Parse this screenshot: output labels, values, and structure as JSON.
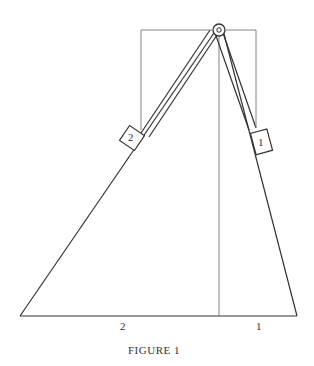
{
  "figure": {
    "caption": "FIGURE 1",
    "base_labels": {
      "left": "2",
      "right": "1"
    },
    "blocks": [
      {
        "id": "block-2",
        "label": "2",
        "incline": "left"
      },
      {
        "id": "block-1",
        "label": "1",
        "incline": "right"
      }
    ],
    "colors": {
      "stroke": "#333333",
      "thin": "#666666",
      "background": "#ffffff"
    }
  }
}
